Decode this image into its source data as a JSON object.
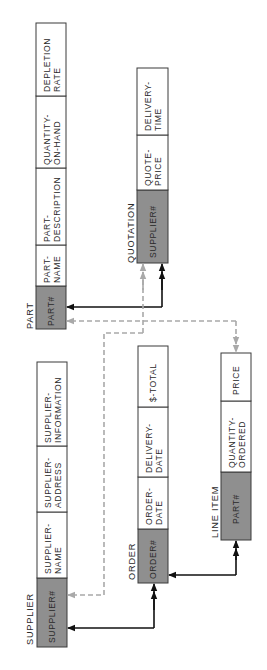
{
  "diagram": {
    "colors": {
      "key_fill": "#8f8f8f",
      "cell_fill": "#ffffff",
      "border": "#3a3a3a",
      "solid_link": "#111111",
      "dashed_link": "#a9a9a9",
      "text": "#2a2a2a"
    },
    "tables": [
      {
        "id": "part",
        "title": "PART",
        "fields": [
          {
            "line1": "PART#",
            "line2": "",
            "key": true
          },
          {
            "line1": "PART-",
            "line2": "NAME",
            "key": false
          },
          {
            "line1": "PART-",
            "line2": "DESCRIPTION",
            "key": false
          },
          {
            "line1": "QUANTITY-",
            "line2": "ON-HAND",
            "key": false
          },
          {
            "line1": "DEPLETION",
            "line2": "RATE",
            "key": false
          }
        ]
      },
      {
        "id": "quotation",
        "title": "QUOTATION",
        "fields": [
          {
            "line1": "SUPPLIER#",
            "line2": "",
            "key": true
          },
          {
            "line1": "QUOTE-",
            "line2": "PRICE",
            "key": false
          },
          {
            "line1": "DELIVERY-",
            "line2": "TIME",
            "key": false
          }
        ]
      },
      {
        "id": "supplier",
        "title": "SUPPLIER",
        "fields": [
          {
            "line1": "SUPPLIER#",
            "line2": "",
            "key": true
          },
          {
            "line1": "SUPPLIER-",
            "line2": "NAME",
            "key": false
          },
          {
            "line1": "SUPPLIER-",
            "line2": "ADDRESS",
            "key": false
          },
          {
            "line1": "SUPPLIER-",
            "line2": "INFORMATION",
            "key": false
          }
        ]
      },
      {
        "id": "order",
        "title": "ORDER",
        "fields": [
          {
            "line1": "ORDER#",
            "line2": "",
            "key": true
          },
          {
            "line1": "ORDER-",
            "line2": "DATE",
            "key": false
          },
          {
            "line1": "DELIVERY-",
            "line2": "DATE",
            "key": false
          },
          {
            "line1": "$-TOTAL",
            "line2": "",
            "key": false
          }
        ]
      },
      {
        "id": "line_item",
        "title": "LINE ITEM",
        "fields": [
          {
            "line1": "PART#",
            "line2": "",
            "key": true
          },
          {
            "line1": "QUANTITY-",
            "line2": "ORDERED",
            "key": false
          },
          {
            "line1": "PRICE",
            "line2": "",
            "key": false
          }
        ]
      }
    ],
    "relationships": [
      {
        "from": "part.PART#",
        "to": "quotation",
        "style": "solid",
        "arrow": "double-at-quotation"
      },
      {
        "from": "part.PART#",
        "to": "line_item",
        "style": "dashed",
        "arrow": "double-at-line-item"
      },
      {
        "from": "quotation.SUPPLIER#",
        "to": "supplier",
        "style": "dashed",
        "arrow": "double-at-quotation"
      },
      {
        "from": "supplier.SUPPLIER#",
        "to": "order",
        "style": "solid",
        "arrow": "double-at-order"
      },
      {
        "from": "order.ORDER#",
        "to": "line_item",
        "style": "solid",
        "arrow": "double-at-line-item"
      }
    ]
  }
}
